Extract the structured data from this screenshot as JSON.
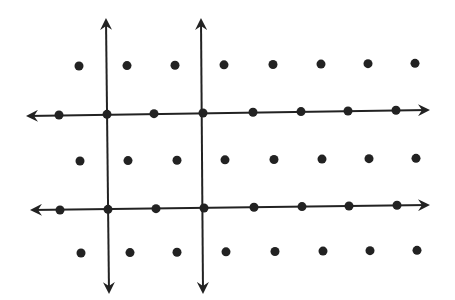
{
  "diagram": {
    "type": "lattice-with-lines",
    "ink_color": "#222222",
    "background": "#ffffff",
    "dot_rows": [
      {
        "y": 66,
        "xs": [
          79,
          127,
          175,
          224,
          273,
          321,
          368,
          415
        ],
        "on_line": false
      },
      {
        "y": 115,
        "xs": [
          59,
          107,
          154,
          203,
          253,
          301,
          348,
          396
        ],
        "on_line": true
      },
      {
        "y": 161,
        "xs": [
          80,
          128,
          177,
          225,
          274,
          322,
          369,
          416
        ],
        "on_line": false
      },
      {
        "y": 210,
        "xs": [
          60,
          108,
          156,
          204,
          254,
          302,
          349,
          397
        ],
        "on_line": true
      },
      {
        "y": 253,
        "xs": [
          81,
          130,
          177,
          226,
          275,
          323,
          370,
          417
        ],
        "on_line": false
      }
    ],
    "horizontal_lines": [
      {
        "x1": 28,
        "y1": 116,
        "x2": 428,
        "y2": 110
      },
      {
        "x1": 32,
        "y1": 210,
        "x2": 428,
        "y2": 205
      }
    ],
    "vertical_lines": [
      {
        "x1": 106,
        "y1": 20,
        "x2": 109,
        "y2": 292
      },
      {
        "x1": 201,
        "y1": 20,
        "x2": 203,
        "y2": 292
      }
    ]
  }
}
